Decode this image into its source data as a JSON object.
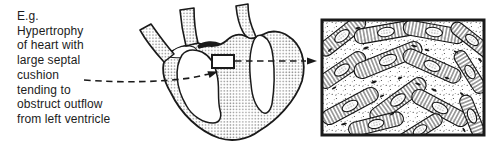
{
  "caption": {
    "text": "E.g.\nHypertrophy\nof heart with\nlarge septal\ncushion\ntending to\nobstruct outflow\nfrom left ventricle"
  },
  "icons": {
    "arrow_caption_to_heart": "dashed-arrow-right-icon",
    "arrow_heart_to_histology": "dashed-arrow-right-icon"
  },
  "colors": {
    "ink": "#1a1a1a",
    "halftone_dot_gray": "#8f8f8f",
    "background": "#ffffff"
  }
}
